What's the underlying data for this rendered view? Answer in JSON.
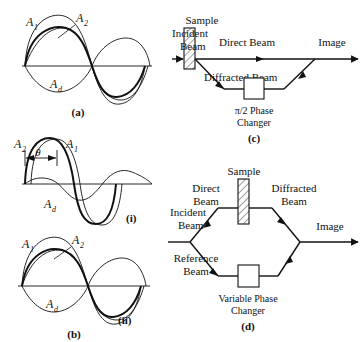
{
  "panel_a": {
    "id": "(a)",
    "labels": {
      "a1": "A",
      "a1_sub": "1",
      "a2": "A",
      "a2_sub": "2",
      "ad": "A",
      "ad_sub": "d"
    }
  },
  "panel_b": {
    "id": "(b)",
    "sub_i": "(i)",
    "sub_ii": "(ii)",
    "theta": "θ",
    "labels": {
      "a1": "A",
      "a1_sub": "1",
      "a2": "A",
      "a2_sub": "2",
      "ad": "A",
      "ad_sub": "d"
    }
  },
  "panel_c": {
    "id": "(c)",
    "sample": "Sample",
    "incident_beam_line1": "Incident",
    "incident_beam_line2": "Beam",
    "direct_beam": "Direct Beam",
    "diffracted_beam": "Diffracted Beam",
    "image": "Image",
    "phase_changer_line1": "π/2 Phase",
    "phase_changer_line2": "Changer"
  },
  "panel_d": {
    "id": "(d)",
    "sample": "Sample",
    "incident_beam_line1": "Incident",
    "incident_beam_line2": "Beam",
    "direct_beam_line1": "Direct",
    "direct_beam_line2": "Beam",
    "reference_beam_line1": "Reference",
    "reference_beam_line2": "Beam",
    "diffracted_beam_line1": "Diffracted",
    "diffracted_beam_line2": "Beam",
    "image": "Image",
    "phase_changer_line1": "Variable Phase",
    "phase_changer_line2": "Changer"
  },
  "colors": {
    "ink": "#111111",
    "background": "#ffffff"
  }
}
